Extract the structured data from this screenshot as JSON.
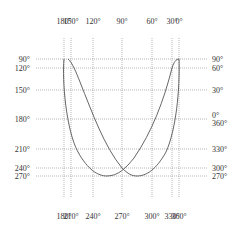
{
  "figure": {
    "type": "phase-angle correspondence diagram",
    "curve_color": "#555555",
    "grid_color": "#9a9a9a"
  },
  "top_axis": {
    "labels": [
      {
        "text": "180°",
        "x": 64
      },
      {
        "text": "150°",
        "x": 71
      },
      {
        "text": "120°",
        "x": 93
      },
      {
        "text": "90°",
        "x": 122
      },
      {
        "text": "60°",
        "x": 152
      },
      {
        "text": "30°",
        "x": 172
      },
      {
        "text": "0°",
        "x": 179
      }
    ]
  },
  "bottom_axis": {
    "labels": [
      {
        "text": "180°",
        "x": 64
      },
      {
        "text": "210°",
        "x": 71
      },
      {
        "text": "240°",
        "x": 93
      },
      {
        "text": "270°",
        "x": 122
      },
      {
        "text": "300°",
        "x": 152
      },
      {
        "text": "330°",
        "x": 172
      },
      {
        "text": "360°",
        "x": 179
      }
    ]
  },
  "left_axis": {
    "labels": [
      {
        "text": "90°",
        "y": 59
      },
      {
        "text": "120°",
        "y": 68
      },
      {
        "text": "150°",
        "y": 90
      },
      {
        "text": "180°",
        "y": 119
      },
      {
        "text": "210°",
        "y": 149
      },
      {
        "text": "240°",
        "y": 168
      },
      {
        "text": "270°",
        "y": 176
      }
    ]
  },
  "right_axis": {
    "labels": [
      {
        "text": "90°",
        "y": 59
      },
      {
        "text": "60°",
        "y": 68
      },
      {
        "text": "30°",
        "y": 90
      },
      {
        "text": "0°",
        "y": 115
      },
      {
        "text": "360°",
        "y": 123
      },
      {
        "text": "330°",
        "y": 149
      },
      {
        "text": "300°",
        "y": 168
      },
      {
        "text": "270°",
        "y": 176
      }
    ]
  },
  "grid": {
    "vertical_x": [
      64,
      71,
      93,
      122,
      152,
      172,
      179
    ],
    "horizontal_y": [
      59,
      68,
      90,
      119,
      149,
      168,
      176
    ],
    "x_range": [
      30,
      212
    ],
    "y_range": [
      36,
      200
    ]
  },
  "curves": [
    {
      "name": "outer-curve",
      "d": "M 64 59 L 68 59 C 70 62, 71 66, 71 68"
    },
    {
      "name": "left-peak-outer-strand",
      "d": "M 64 59 C 62 80, 66 130, 78 152 C 88 170, 98 176, 107 176 C 118 176, 126 168, 134 158 C 152 132, 164 100, 172 68 C 174 62, 176 59, 179 59"
    },
    {
      "name": "left-peak-inner-strand",
      "d": "M 68 59 C 72 62, 76 72, 80 82 C 92 112, 104 146, 122 168 C 128 174, 132 176, 137 176 C 146 176, 156 170, 166 152 C 176 130, 180 90, 179 59"
    }
  ]
}
